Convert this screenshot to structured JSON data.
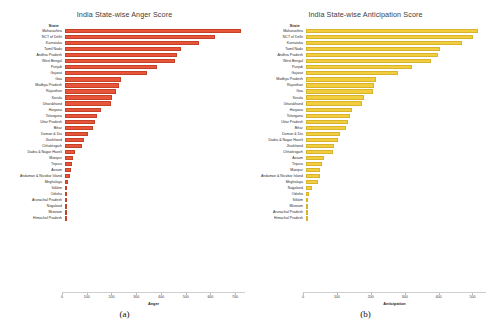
{
  "figure": {
    "panels": [
      {
        "caption": "(a)",
        "state_column_header": "State",
        "color": "#E8553A",
        "bar_edge": "#C44228",
        "chart_data": {
          "type": "bar",
          "orientation": "horizontal",
          "title": "India State-wise Anger Score",
          "xlabel": "Anger",
          "ylabel": "State",
          "xlim": [
            0,
            740
          ],
          "xticks": [
            0,
            100,
            200,
            300,
            400,
            500,
            600,
            700
          ],
          "grid": false,
          "legend": "none",
          "categories": [
            "Maharashtra",
            "NCT of Delhi",
            "Karnataka",
            "Tamil Nadu",
            "Andhra Pradesh",
            "West Bengal",
            "Punjab",
            "Gujarat",
            "Goa",
            "Madhya Pradesh",
            "Rajasthan",
            "Kerala",
            "Uttarakhand",
            "Haryana",
            "Telangana",
            "Uttar Pradesh",
            "Bihar",
            "Daman & Diu",
            "Jharkhand",
            "Chhattisgarh",
            "Dadra & Nagar Haveli",
            "Manipur",
            "Tripura",
            "Assam",
            "Andaman & Nicobar Island",
            "Meghalaya",
            "Sikkim",
            "Odisha",
            "Arunachal Pradesh",
            "Nagaland",
            "Mizoram",
            "Himachal Pradesh"
          ],
          "values": [
            722,
            618,
            552,
            478,
            462,
            452,
            380,
            340,
            232,
            222,
            210,
            196,
            190,
            150,
            132,
            126,
            118,
            96,
            78,
            70,
            44,
            36,
            32,
            26,
            22,
            16,
            6,
            5,
            4,
            3,
            2,
            1
          ]
        }
      },
      {
        "caption": "(b)",
        "state_column_header": "State",
        "color": "#F2CE3E",
        "bar_edge": "#D8B32C",
        "chart_data": {
          "type": "bar",
          "orientation": "horizontal",
          "title": "India State-wise Anticipation Score",
          "xlabel": "Anticipation",
          "ylabel": "State",
          "xlim": [
            0,
            540
          ],
          "xticks": [
            0,
            100,
            200,
            300,
            400,
            500
          ],
          "grid": false,
          "legend": "none",
          "categories": [
            "Maharashtra",
            "NCT of Delhi",
            "Karnataka",
            "Tamil Nadu",
            "Andhra Pradesh",
            "West Bengal",
            "Punjab",
            "Gujarat",
            "Madhya Pradesh",
            "Rajasthan",
            "Goa",
            "Kerala",
            "Uttarakhand",
            "Haryana",
            "Telangana",
            "Uttar Pradesh",
            "Bihar",
            "Daman & Diu",
            "Dadra & Nagar Haveli",
            "Jharkhand",
            "Chhattisgarh",
            "Assam",
            "Tripura",
            "Manipur",
            "Andaman & Nicobar Island",
            "Meghalaya",
            "Nagaland",
            "Odisha",
            "Sikkim",
            "Mizoram",
            "Arunachal Pradesh",
            "Himachal Pradesh"
          ],
          "values": [
            516,
            500,
            468,
            402,
            396,
            376,
            320,
            276,
            212,
            206,
            202,
            176,
            170,
            140,
            134,
            128,
            122,
            104,
            96,
            86,
            82,
            54,
            48,
            44,
            42,
            36,
            20,
            10,
            8,
            6,
            3,
            2
          ]
        }
      }
    ]
  }
}
